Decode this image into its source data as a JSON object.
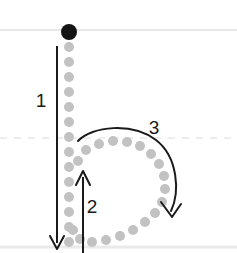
{
  "worksheet": {
    "kind": "handwriting-stroke-order-diagram",
    "letter": "b",
    "background_color": "#ffffff",
    "guidelines": [
      {
        "name": "ascender-line",
        "style": "solid",
        "y": 30,
        "color": "#e8e8e8"
      },
      {
        "name": "midline",
        "style": "dashed",
        "y": 138,
        "color": "#ededed"
      },
      {
        "name": "baseline",
        "style": "solid",
        "y": 247,
        "color": "#eaeaea"
      }
    ],
    "start_dot": {
      "name": "start-point",
      "cx": 69,
      "cy": 32,
      "r": 8,
      "color": "#141414"
    },
    "trace_dots": {
      "color": "#c2c2c2",
      "radius": 5,
      "stem": [
        {
          "cx": 69,
          "cy": 47
        },
        {
          "cx": 69,
          "cy": 62
        },
        {
          "cx": 69,
          "cy": 77
        },
        {
          "cx": 69,
          "cy": 92
        },
        {
          "cx": 69,
          "cy": 107
        },
        {
          "cx": 69,
          "cy": 122
        },
        {
          "cx": 69,
          "cy": 137
        },
        {
          "cx": 69,
          "cy": 152
        },
        {
          "cx": 69,
          "cy": 167
        },
        {
          "cx": 69,
          "cy": 182
        },
        {
          "cx": 69,
          "cy": 197
        },
        {
          "cx": 69,
          "cy": 212
        },
        {
          "cx": 69,
          "cy": 227
        },
        {
          "cx": 69,
          "cy": 242
        }
      ],
      "bowl": [
        {
          "cx": 78,
          "cy": 161
        },
        {
          "cx": 86,
          "cy": 150
        },
        {
          "cx": 99,
          "cy": 144
        },
        {
          "cx": 113,
          "cy": 141
        },
        {
          "cx": 127,
          "cy": 142
        },
        {
          "cx": 140,
          "cy": 146
        },
        {
          "cx": 151,
          "cy": 154
        },
        {
          "cx": 159,
          "cy": 164
        },
        {
          "cx": 164,
          "cy": 176
        },
        {
          "cx": 165,
          "cy": 189
        },
        {
          "cx": 162,
          "cy": 202
        },
        {
          "cx": 155,
          "cy": 213
        },
        {
          "cx": 145,
          "cy": 222
        },
        {
          "cx": 133,
          "cy": 230
        },
        {
          "cx": 120,
          "cy": 236
        },
        {
          "cx": 106,
          "cy": 240
        },
        {
          "cx": 92,
          "cy": 242
        },
        {
          "cx": 80,
          "cy": 239
        },
        {
          "cx": 73,
          "cy": 230
        }
      ]
    },
    "strokes": [
      {
        "name": "stroke-1-downstroke",
        "label": "1",
        "label_x": 41,
        "label_y": 107,
        "direction": "down",
        "path": "M 57 46 L 57 243",
        "arrowhead": "M 50 236 L 57 249 L 64 236",
        "color": "#1a1a1a"
      },
      {
        "name": "stroke-2-upstroke",
        "label": "2",
        "label_x": 92,
        "label_y": 213,
        "direction": "up",
        "path": "M 83 252 L 83 177",
        "arrowhead": "M 76 185 L 83 171 L 90 185",
        "color": "#1a1a1a"
      },
      {
        "name": "stroke-3-bowl-curve",
        "label": "3",
        "label_x": 154,
        "label_y": 134,
        "direction": "clockwise",
        "path": "M 78 141 C 92 126, 132 122, 156 140 C 178 157, 180 192, 171 212",
        "arrowhead": "M 162 203 L 172 216 L 180 205",
        "color": "#1a1a1a"
      }
    ]
  }
}
